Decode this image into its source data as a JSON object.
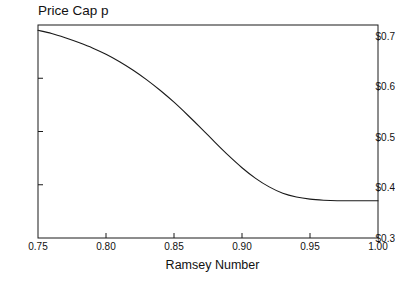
{
  "chart_data": {
    "type": "line",
    "title": "Price Cap p",
    "subtitle": "",
    "xlabel": "Ramsey Number",
    "ylabel": "",
    "xlim": [
      0.75,
      1.0
    ],
    "ylim": [
      0.3,
      0.7
    ],
    "grid": false,
    "legend": null,
    "xticks": [
      0.75,
      0.8,
      0.85,
      0.9,
      0.95,
      1.0
    ],
    "xtick_labels": [
      "0.75",
      "0.80",
      "0.85",
      "0.90",
      "0.95",
      "1.00"
    ],
    "yticks": [
      0.3,
      0.4,
      0.5,
      0.6,
      0.7
    ],
    "ytick_labels": [
      "$0.3",
      "$0.4",
      "$0.5",
      "$0.6",
      "$0.7"
    ],
    "line_color": "#1a1a1a",
    "frame_color": "#1a1a1a",
    "series": [
      {
        "name": "Price Cap p",
        "x": [
          0.75,
          0.76,
          0.77,
          0.78,
          0.79,
          0.8,
          0.81,
          0.82,
          0.83,
          0.84,
          0.85,
          0.86,
          0.87,
          0.88,
          0.89,
          0.9,
          0.91,
          0.92,
          0.93,
          0.94,
          0.95,
          0.96,
          0.97,
          0.98,
          0.99,
          1.0
        ],
        "values": [
          0.69,
          0.684,
          0.676,
          0.667,
          0.657,
          0.645,
          0.631,
          0.615,
          0.597,
          0.577,
          0.555,
          0.531,
          0.506,
          0.48,
          0.455,
          0.432,
          0.412,
          0.396,
          0.384,
          0.377,
          0.373,
          0.371,
          0.37,
          0.37,
          0.37,
          0.37
        ]
      }
    ],
    "annotations": []
  },
  "axes": {
    "title_text": "Price Cap p",
    "x_title_text": "Ramsey Number"
  }
}
